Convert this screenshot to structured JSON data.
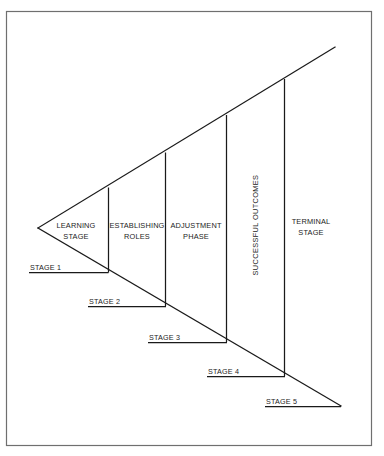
{
  "figure": {
    "background_color": "#ffffff",
    "border_color": "#6f6f6f",
    "line_color": "#1a1a1a"
  },
  "segments": [
    {
      "id": "learning-stage",
      "label_line_1": "LEARNING",
      "label_line_2": "STAGE",
      "orientation": "horizontal"
    },
    {
      "id": "establishing-roles",
      "label_line_1": "ESTABLISHING",
      "label_line_2": "ROLES",
      "orientation": "horizontal"
    },
    {
      "id": "adjustment-phase",
      "label_line_1": "ADJUSTMENT",
      "label_line_2": "PHASE",
      "orientation": "horizontal"
    },
    {
      "id": "successful-outcomes",
      "label_line_1": "SUCCESSFUL OUTCOMES",
      "label_line_2": "",
      "orientation": "vertical"
    },
    {
      "id": "terminal-stage",
      "label_line_1": "TERMINAL",
      "label_line_2": "STAGE",
      "orientation": "horizontal"
    }
  ],
  "stages": [
    {
      "id": "stage-1",
      "label": "STAGE 1"
    },
    {
      "id": "stage-2",
      "label": "STAGE 2"
    },
    {
      "id": "stage-3",
      "label": "STAGE 3"
    },
    {
      "id": "stage-4",
      "label": "STAGE 4"
    },
    {
      "id": "stage-5",
      "label": "STAGE 5"
    }
  ]
}
